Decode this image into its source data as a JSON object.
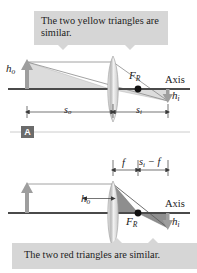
{
  "figure": {
    "panels": [
      {
        "id": "A",
        "badge": "A",
        "callout": "The two yellow triangles are similar.",
        "callout_position": "top",
        "shade_color": "#d8d8d8",
        "labels": {
          "object_height": "h",
          "object_height_sub": "o",
          "image_height": "h",
          "image_height_sub": "i",
          "focal_point": "F",
          "focal_point_sub": "R",
          "axis": "Axis",
          "object_distance": "s",
          "object_distance_sub": "o",
          "image_distance": "s",
          "image_distance_sub": "i"
        }
      },
      {
        "id": "B",
        "badge": "",
        "callout": "The two red triangles are similar.",
        "callout_position": "bottom",
        "shade_color": "#8e8e8e",
        "labels": {
          "object_height": "h",
          "object_height_sub": "o",
          "image_height": "h",
          "image_height_sub": "i",
          "focal_point": "F",
          "focal_point_sub": "R",
          "axis": "Axis",
          "focal_length": "f",
          "image_minus_focal": "s",
          "image_minus_focal_sub": "i",
          "image_minus_focal_rest": " − f"
        }
      }
    ],
    "colors": {
      "callout_background": "#d6d6d6",
      "axis": "#4a4a4a",
      "ray": "#7a7a7a",
      "object_arrow": "#9a9a9a",
      "lens": "#cfcfcf",
      "badge_background": "#6b6b6b",
      "text": "#1a1a1a",
      "triangle_top": "#d8d8d8",
      "triangle_bottom": "#8e8e8e"
    }
  }
}
